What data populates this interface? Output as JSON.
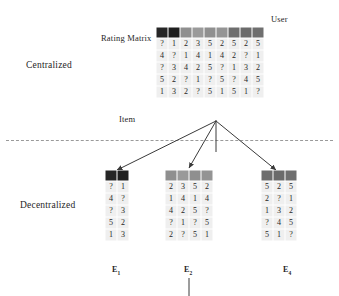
{
  "figure": {
    "labels": {
      "centralized": "Centralized",
      "decentralized": "Decentralized",
      "rating_matrix": "Rating Matrix",
      "user_axis": "User",
      "item_axis": "Item"
    },
    "colors": {
      "cell_background": "#efefef",
      "header_dark": "#2b2b2b",
      "header_mid": "#8c8c8c",
      "header_gray": "#777777",
      "text": "#1f1f1f",
      "divider": "#9a9a9a",
      "arrow": "#3a3a3a"
    }
  },
  "central_matrix": {
    "name": "Rating Matrix",
    "header_shades": [
      "#262626",
      "#1f1f1f",
      "#8f8f8f",
      "#9a9a9a",
      "#8f8f8f",
      "#949494",
      "#6e6e6e",
      "#6b6b6b",
      "#6f6f6f"
    ],
    "rows": [
      [
        "?",
        "1",
        "2",
        "3",
        "5",
        "2",
        "5",
        "2",
        "5"
      ],
      [
        "4",
        "?",
        "1",
        "4",
        "1",
        "4",
        "2",
        "?",
        "1"
      ],
      [
        "?",
        "3",
        "4",
        "2",
        "5",
        "?",
        "1",
        "3",
        "2"
      ],
      [
        "5",
        "2",
        "?",
        "1",
        "?",
        "5",
        "?",
        "4",
        "5"
      ],
      [
        "1",
        "3",
        "2",
        "?",
        "5",
        "1",
        "5",
        "1",
        "?"
      ]
    ]
  },
  "decentralized_matrices": [
    {
      "label": "E",
      "subscript": "1",
      "header_shades": [
        "#262626",
        "#1f1f1f"
      ],
      "rows": [
        [
          "?",
          "1"
        ],
        [
          "4",
          "?"
        ],
        [
          "?",
          "3"
        ],
        [
          "5",
          "2"
        ],
        [
          "1",
          "3"
        ]
      ]
    },
    {
      "label": "E",
      "subscript": "2",
      "header_shades": [
        "#8f8f8f",
        "#9a9a9a",
        "#8f8f8f",
        "#949494"
      ],
      "rows": [
        [
          "2",
          "3",
          "5",
          "2"
        ],
        [
          "1",
          "4",
          "1",
          "4"
        ],
        [
          "4",
          "2",
          "5",
          "?"
        ],
        [
          "?",
          "1",
          "?",
          "5"
        ],
        [
          "2",
          "?",
          "5",
          "1"
        ]
      ]
    },
    {
      "label": "E",
      "subscript": "4",
      "header_shades": [
        "#6e6e6e",
        "#6b6b6b",
        "#6f6f6f"
      ],
      "rows": [
        [
          "5",
          "2",
          "5"
        ],
        [
          "2",
          "?",
          "1"
        ],
        [
          "1",
          "3",
          "2"
        ],
        [
          "?",
          "4",
          "5"
        ],
        [
          "5",
          "1",
          "?"
        ]
      ]
    }
  ]
}
